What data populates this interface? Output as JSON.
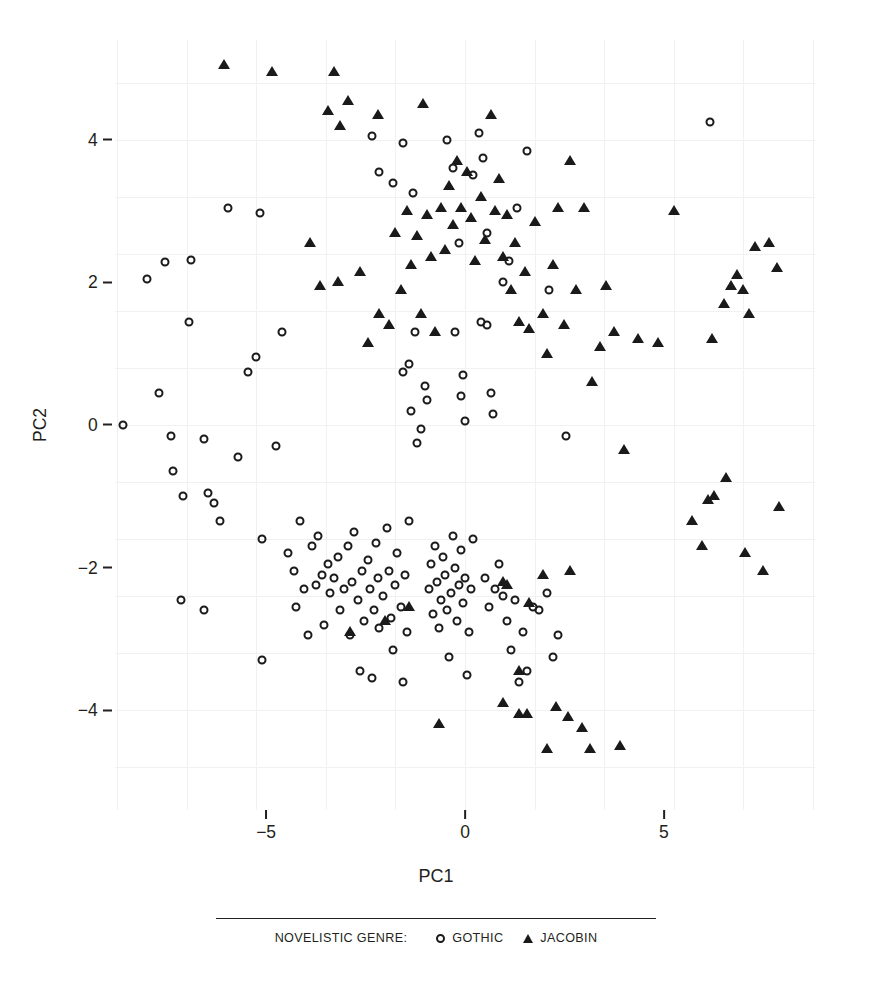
{
  "chart_data": {
    "type": "scatter",
    "title": "",
    "xlabel": "PC1",
    "ylabel": "PC2",
    "xlim": [
      -8.8,
      8.8
    ],
    "ylim": [
      -5.4,
      5.4
    ],
    "xticks": [
      -5,
      0,
      5
    ],
    "xtick_labels": [
      "−5",
      "0",
      "5"
    ],
    "yticks": [
      4,
      2,
      0,
      -2,
      -4
    ],
    "ytick_labels": [
      "4",
      "2",
      "0",
      "−2",
      "−4"
    ],
    "grid": true,
    "grid_color": "#f1f1f1",
    "legend_position": "bottom",
    "legend_title": "NOVELISTIC GENRE:",
    "marker_color": "#1a1a1a",
    "background": "#ffffff",
    "series": [
      {
        "name": "GOTHIC",
        "marker": "open-circle",
        "points": [
          [
            -8.6,
            0.0
          ],
          [
            -8.0,
            2.05
          ],
          [
            -7.55,
            2.28
          ],
          [
            -7.7,
            0.45
          ],
          [
            -7.4,
            -0.15
          ],
          [
            -7.35,
            -0.65
          ],
          [
            -7.15,
            -2.45
          ],
          [
            -6.9,
            2.32
          ],
          [
            -6.95,
            1.45
          ],
          [
            -7.1,
            -1.0
          ],
          [
            -6.55,
            -0.2
          ],
          [
            -6.45,
            -0.95
          ],
          [
            -6.3,
            -1.1
          ],
          [
            -6.15,
            -1.35
          ],
          [
            -6.55,
            -2.6
          ],
          [
            -5.95,
            3.05
          ],
          [
            -5.7,
            -0.45
          ],
          [
            -5.25,
            0.95
          ],
          [
            -5.45,
            0.75
          ],
          [
            -5.15,
            2.98
          ],
          [
            -5.1,
            -1.6
          ],
          [
            -5.1,
            -3.3
          ],
          [
            -4.75,
            -0.3
          ],
          [
            -4.6,
            1.3
          ],
          [
            -4.45,
            -1.8
          ],
          [
            -4.3,
            -2.05
          ],
          [
            -4.25,
            -2.55
          ],
          [
            -4.15,
            -1.35
          ],
          [
            -4.05,
            -2.3
          ],
          [
            -3.95,
            -2.95
          ],
          [
            -3.85,
            -1.7
          ],
          [
            -3.75,
            -2.25
          ],
          [
            -3.7,
            -1.55
          ],
          [
            -3.6,
            -2.1
          ],
          [
            -3.55,
            -2.8
          ],
          [
            -3.45,
            -1.95
          ],
          [
            -3.4,
            -2.35
          ],
          [
            -3.3,
            -2.15
          ],
          [
            -3.2,
            -1.85
          ],
          [
            -3.15,
            -2.6
          ],
          [
            -3.05,
            -2.3
          ],
          [
            -2.95,
            -1.7
          ],
          [
            -2.9,
            -2.95
          ],
          [
            -2.85,
            -2.2
          ],
          [
            -2.8,
            -1.5
          ],
          [
            -2.7,
            -2.45
          ],
          [
            -2.65,
            -3.45
          ],
          [
            -2.6,
            -2.05
          ],
          [
            -2.55,
            -2.75
          ],
          [
            -2.45,
            -1.9
          ],
          [
            -2.4,
            -2.3
          ],
          [
            -2.35,
            -3.55
          ],
          [
            -2.3,
            -2.6
          ],
          [
            -2.25,
            -1.65
          ],
          [
            -2.2,
            -2.15
          ],
          [
            -2.15,
            -2.85
          ],
          [
            -2.05,
            -2.4
          ],
          [
            -1.95,
            -1.45
          ],
          [
            -1.9,
            -2.05
          ],
          [
            -1.85,
            -2.7
          ],
          [
            -1.8,
            -3.15
          ],
          [
            -1.75,
            -2.25
          ],
          [
            -1.7,
            -1.8
          ],
          [
            -1.6,
            -2.55
          ],
          [
            -1.55,
            -3.6
          ],
          [
            -1.5,
            -2.1
          ],
          [
            -1.45,
            -2.9
          ],
          [
            -1.4,
            -1.35
          ],
          [
            -2.35,
            4.05
          ],
          [
            -2.15,
            3.55
          ],
          [
            -1.8,
            3.4
          ],
          [
            -1.55,
            3.95
          ],
          [
            -1.3,
            3.25
          ],
          [
            -1.25,
            1.3
          ],
          [
            -1.4,
            0.85
          ],
          [
            -1.55,
            0.75
          ],
          [
            -1.35,
            0.2
          ],
          [
            -1.2,
            -0.25
          ],
          [
            -1.1,
            -0.05
          ],
          [
            -1.0,
            0.55
          ],
          [
            -0.95,
            0.35
          ],
          [
            -0.9,
            -2.3
          ],
          [
            -0.85,
            -1.95
          ],
          [
            -0.8,
            -2.65
          ],
          [
            -0.75,
            -1.7
          ],
          [
            -0.7,
            -2.2
          ],
          [
            -0.65,
            -2.85
          ],
          [
            -0.6,
            -2.45
          ],
          [
            -0.55,
            -1.85
          ],
          [
            -0.5,
            -2.1
          ],
          [
            -0.45,
            -2.6
          ],
          [
            -0.4,
            -3.25
          ],
          [
            -0.35,
            -2.35
          ],
          [
            -0.3,
            -1.55
          ],
          [
            -0.25,
            -2.0
          ],
          [
            -0.2,
            -2.75
          ],
          [
            -0.15,
            -2.25
          ],
          [
            -0.1,
            -1.75
          ],
          [
            -0.05,
            -2.5
          ],
          [
            0.0,
            -2.15
          ],
          [
            0.05,
            -3.5
          ],
          [
            0.1,
            -2.9
          ],
          [
            0.15,
            -2.3
          ],
          [
            0.2,
            -1.6
          ],
          [
            -0.45,
            4.0
          ],
          [
            -0.3,
            3.6
          ],
          [
            -0.15,
            2.55
          ],
          [
            -0.25,
            1.3
          ],
          [
            -0.1,
            0.4
          ],
          [
            -0.05,
            0.7
          ],
          [
            0.0,
            0.05
          ],
          [
            0.2,
            3.5
          ],
          [
            0.35,
            4.1
          ],
          [
            0.45,
            3.75
          ],
          [
            0.55,
            2.7
          ],
          [
            0.4,
            1.45
          ],
          [
            0.55,
            1.4
          ],
          [
            0.65,
            0.45
          ],
          [
            0.7,
            0.15
          ],
          [
            0.5,
            -2.15
          ],
          [
            0.6,
            -2.55
          ],
          [
            0.75,
            -2.3
          ],
          [
            0.85,
            -1.95
          ],
          [
            0.95,
            -2.4
          ],
          [
            1.05,
            -2.75
          ],
          [
            1.15,
            -3.15
          ],
          [
            1.25,
            -2.45
          ],
          [
            1.35,
            -3.6
          ],
          [
            1.45,
            -2.9
          ],
          [
            1.55,
            -3.45
          ],
          [
            1.7,
            -2.55
          ],
          [
            1.85,
            -2.6
          ],
          [
            2.05,
            -2.35
          ],
          [
            2.2,
            -3.25
          ],
          [
            2.35,
            -2.95
          ],
          [
            2.55,
            -0.15
          ],
          [
            0.95,
            2.0
          ],
          [
            1.1,
            2.3
          ],
          [
            1.3,
            3.05
          ],
          [
            1.55,
            3.85
          ],
          [
            2.1,
            1.9
          ],
          [
            6.15,
            4.25
          ]
        ]
      },
      {
        "name": "JACOBIN",
        "marker": "filled-triangle",
        "points": [
          [
            -6.05,
            5.05
          ],
          [
            -4.85,
            4.95
          ],
          [
            -3.3,
            4.95
          ],
          [
            -3.45,
            4.4
          ],
          [
            -3.15,
            4.2
          ],
          [
            -2.95,
            4.55
          ],
          [
            -2.2,
            4.35
          ],
          [
            -1.05,
            4.5
          ],
          [
            -3.9,
            2.55
          ],
          [
            -3.65,
            1.95
          ],
          [
            -3.2,
            2.0
          ],
          [
            -2.65,
            2.15
          ],
          [
            -2.45,
            1.15
          ],
          [
            -2.15,
            1.55
          ],
          [
            -1.9,
            1.4
          ],
          [
            -1.75,
            2.7
          ],
          [
            -1.6,
            1.9
          ],
          [
            -1.45,
            3.0
          ],
          [
            -1.35,
            2.25
          ],
          [
            -1.2,
            2.65
          ],
          [
            -1.1,
            1.55
          ],
          [
            -0.95,
            2.95
          ],
          [
            -0.85,
            2.35
          ],
          [
            -0.75,
            1.3
          ],
          [
            -0.6,
            3.05
          ],
          [
            -0.5,
            2.45
          ],
          [
            -0.4,
            3.35
          ],
          [
            -0.3,
            2.8
          ],
          [
            -0.2,
            3.7
          ],
          [
            -0.1,
            3.05
          ],
          [
            0.05,
            3.55
          ],
          [
            0.15,
            2.9
          ],
          [
            0.25,
            2.3
          ],
          [
            0.4,
            3.2
          ],
          [
            0.5,
            2.6
          ],
          [
            0.65,
            4.35
          ],
          [
            0.75,
            3.0
          ],
          [
            0.85,
            3.45
          ],
          [
            0.95,
            2.35
          ],
          [
            1.05,
            2.95
          ],
          [
            1.15,
            1.9
          ],
          [
            1.25,
            2.55
          ],
          [
            1.35,
            1.45
          ],
          [
            1.5,
            2.15
          ],
          [
            1.6,
            1.35
          ],
          [
            1.75,
            2.85
          ],
          [
            1.95,
            1.55
          ],
          [
            2.05,
            1.0
          ],
          [
            2.2,
            2.25
          ],
          [
            2.35,
            3.05
          ],
          [
            2.5,
            1.4
          ],
          [
            2.65,
            3.7
          ],
          [
            2.8,
            1.9
          ],
          [
            3.0,
            3.05
          ],
          [
            3.2,
            0.6
          ],
          [
            3.4,
            1.1
          ],
          [
            3.55,
            1.95
          ],
          [
            3.75,
            1.3
          ],
          [
            4.0,
            -0.35
          ],
          [
            4.35,
            1.2
          ],
          [
            4.85,
            1.15
          ],
          [
            5.25,
            3.0
          ],
          [
            6.2,
            1.2
          ],
          [
            6.5,
            1.7
          ],
          [
            6.7,
            1.95
          ],
          [
            6.85,
            2.1
          ],
          [
            7.0,
            1.9
          ],
          [
            7.15,
            1.55
          ],
          [
            7.3,
            2.5
          ],
          [
            7.65,
            2.55
          ],
          [
            7.85,
            2.2
          ],
          [
            5.7,
            -1.35
          ],
          [
            5.95,
            -1.7
          ],
          [
            6.1,
            -1.05
          ],
          [
            6.25,
            -1.0
          ],
          [
            6.55,
            -0.75
          ],
          [
            7.05,
            -1.8
          ],
          [
            7.5,
            -2.05
          ],
          [
            7.9,
            -1.15
          ],
          [
            2.65,
            -2.05
          ],
          [
            1.95,
            -2.1
          ],
          [
            1.6,
            -2.5
          ],
          [
            0.95,
            -2.2
          ],
          [
            1.05,
            -2.25
          ],
          [
            -1.4,
            -2.55
          ],
          [
            -2.0,
            -2.75
          ],
          [
            -2.9,
            -2.9
          ],
          [
            1.35,
            -3.45
          ],
          [
            0.95,
            -3.9
          ],
          [
            1.35,
            -4.05
          ],
          [
            1.55,
            -4.05
          ],
          [
            2.05,
            -4.55
          ],
          [
            2.6,
            -4.1
          ],
          [
            2.95,
            -4.25
          ],
          [
            3.15,
            -4.55
          ],
          [
            3.9,
            -4.5
          ],
          [
            -0.65,
            -4.2
          ],
          [
            2.3,
            -3.95
          ]
        ]
      }
    ]
  }
}
